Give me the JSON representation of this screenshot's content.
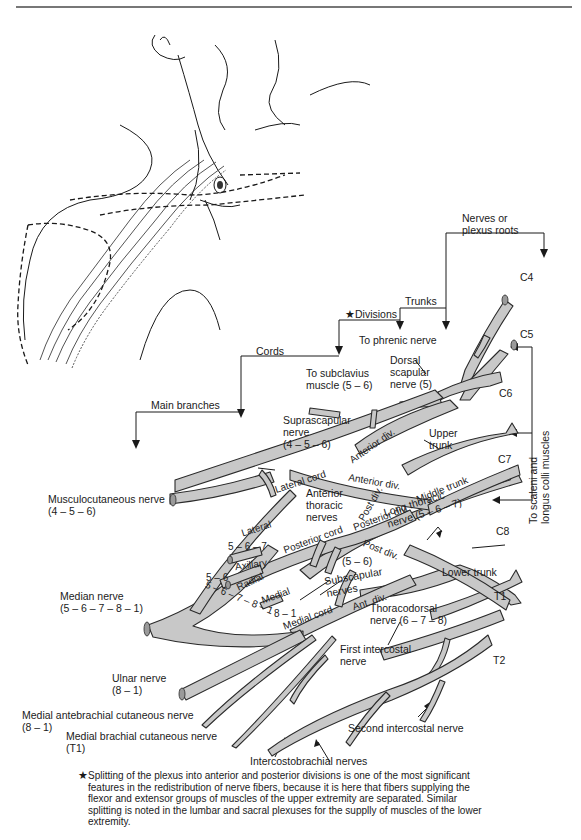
{
  "figure": {
    "colors": {
      "nerve_fill": "#c8c8c8",
      "nerve_stroke": "#2a2a2a",
      "line": "#1a1a1a",
      "rule": "#777777"
    }
  },
  "hierarchy_labels": {
    "roots": "Nerves or\nplexus roots",
    "trunks": "Trunks",
    "divisions": "★Divisions",
    "cords": "Cords",
    "main_branches": "Main branches"
  },
  "root_labels": [
    "C4",
    "C5",
    "C6",
    "C7",
    "C8",
    "T1",
    "T2"
  ],
  "branch_labels": {
    "phrenic": "To phrenic nerve",
    "dorsal_scapular": "Dorsal\nscapular\nnerve (5)",
    "subclavius": "To subclavius\nmuscle (5 – 6)",
    "suprascapular": "Suprascapular\nnerve\n(4 – 5 – 6)",
    "upper_trunk": "Upper\ntrunk",
    "middle_trunk": "Middle trunk",
    "lower_trunk": "Lower trunk",
    "scaleni": "To scaleni and\nlongus colli muscles",
    "long_thoracic": "Long thoracic\nnerve (5 – 6 – 7)",
    "musculocutaneous": "Musculocutaneous nerve\n(4 – 5 – 6)",
    "median": "Median nerve\n(5 – 6 – 7 – 8 – 1)",
    "ulnar": "Ulnar nerve\n(8 – 1)",
    "medial_antebrachial": "Medial antebrachial cutaneous nerve\n(8 – 1)",
    "medial_brachial": "Medial brachial cutaneous nerve\n(T1)",
    "thoracodorsal": "Thoracodorsal\nnerve (6 – 7 – 8)",
    "first_intercostal": "First intercostal\nnerve",
    "second_intercostal": "Second intercostal nerve",
    "intercostobrachial": "Intercostobrachial nerves",
    "subscapular": "Subscapular\nnerves",
    "subscapular_roots": "(5 – 6)",
    "anterior_thoracic": "Anterior\nthoracic\nnerves"
  },
  "inline_labels": {
    "lateral_cord": "Lateral cord",
    "posterior_cord": "Posterior cord",
    "medial_cord": "Medial cord",
    "anterior_div_1": "Anterior div.",
    "anterior_div_2": "Anterior div.",
    "posterior_div": "Posterior div.",
    "post_div_1": "Post div.",
    "post_div_2": "Post div.",
    "ant_div": "Ant. div.",
    "lateral": "Lateral",
    "lateral_roots": "5 – 6 – 7",
    "axillary": "Axillary",
    "radial": "Radial",
    "radial_roots_a": "5 – 6",
    "radial_roots_b": "5 – 6 – 7 – 8 – 1",
    "medial": "Medial",
    "medial_roots": "8 – 1"
  },
  "footnote": {
    "marker": "★",
    "text": "Splitting of the plexus into anterior and posterior divisions is one of the most significant features in the redistribution of nerve fibers, because it is here that fibers supplying the flexor and extensor groups of muscles of the upper extremity are separated.  Similar splitting is noted in the lumbar and sacral plexuses for the supplly of muscles of the lower extremity."
  }
}
